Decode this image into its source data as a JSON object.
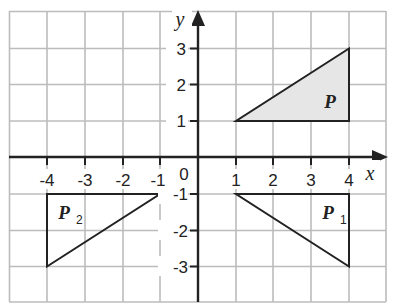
{
  "figure": {
    "type": "coordinate-grid-reflection",
    "x_axis": {
      "label": "x",
      "ticks": [
        -4,
        -3,
        -2,
        -1,
        1,
        2,
        3,
        4
      ],
      "range": [
        -5,
        5
      ]
    },
    "y_axis": {
      "label": "y",
      "ticks": [
        -3,
        -2,
        -1,
        1,
        2,
        3
      ],
      "range": [
        -4,
        4
      ]
    },
    "origin_label": "0",
    "colors": {
      "grid": "#b8b8b8",
      "axis": "#222222",
      "shape_fill": "#e6e6e6",
      "shape_stroke": "#222222"
    },
    "shapes": [
      {
        "name": "P",
        "label": "P",
        "subscript": "",
        "vertices": [
          [
            1,
            1
          ],
          [
            4,
            1
          ],
          [
            4,
            3
          ]
        ],
        "filled": true,
        "label_pos": [
          3.5,
          1.5
        ]
      },
      {
        "name": "P1",
        "label": "P",
        "subscript": "1",
        "vertices": [
          [
            1,
            -1
          ],
          [
            4,
            -1
          ],
          [
            4,
            -3
          ]
        ],
        "filled": false,
        "label_pos": [
          3.5,
          -1.5
        ]
      },
      {
        "name": "P2",
        "label": "P",
        "subscript": "2",
        "vertices": [
          [
            -1,
            -1
          ],
          [
            -4,
            -1
          ],
          [
            -4,
            -3
          ]
        ],
        "filled": false,
        "label_pos": [
          -3.5,
          -1.5
        ]
      }
    ]
  },
  "labels": {
    "x": "x",
    "y": "y",
    "origin": "0",
    "xt": {
      "m4": "-4",
      "m3": "-3",
      "m2": "-2",
      "m1": "-1",
      "p1": "1",
      "p2": "2",
      "p3": "3",
      "p4": "4"
    },
    "yt": {
      "p3": "3",
      "p2": "2",
      "p1": "1",
      "m1": "-1",
      "m2": "-2",
      "m3": "-3"
    },
    "P": "P",
    "P1": "P",
    "P1sub": "1",
    "P2": "P",
    "P2sub": "2"
  }
}
